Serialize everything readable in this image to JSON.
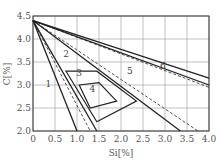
{
  "chart_data": {
    "type": "line",
    "title": "",
    "xlabel": "Si[%]",
    "ylabel": "C[%]",
    "xlim": [
      0,
      4.0
    ],
    "ylim": [
      2.0,
      4.5
    ],
    "grid": true,
    "x_ticks": [
      "0",
      "0.5",
      "1.0",
      "1.5",
      "2.0",
      "2.5",
      "3.0",
      "3.5",
      "4.0"
    ],
    "y_ticks": [
      "2.0",
      "2.5",
      "3.0",
      "3.5",
      "4.0",
      "4.5"
    ],
    "origin_point": {
      "si": 0,
      "c": 4.4
    },
    "boundary_lines": [
      {
        "name": "1/2 boundary",
        "style": "solid",
        "from": [
          0,
          4.4
        ],
        "to": [
          1.0,
          2.0
        ]
      },
      {
        "name": "2 left inner",
        "style": "dashed",
        "from": [
          0,
          4.4
        ],
        "to": [
          1.3,
          2.0
        ]
      },
      {
        "name": "2 right",
        "style": "solid",
        "from": [
          0,
          4.4
        ],
        "to": [
          1.45,
          2.0
        ]
      },
      {
        "name": "2/5 lower solid",
        "style": "solid",
        "from": [
          0,
          4.4
        ],
        "to": [
          3.35,
          2.0
        ]
      },
      {
        "name": "5 dashed",
        "style": "dashed",
        "from": [
          0,
          4.4
        ],
        "to": [
          3.75,
          2.0
        ]
      },
      {
        "name": "5/6 dashed",
        "style": "dashed",
        "from": [
          0,
          4.4
        ],
        "to": [
          4.0,
          2.95
        ]
      },
      {
        "name": "5/6 solid",
        "style": "solid",
        "from": [
          0,
          4.4
        ],
        "to": [
          4.0,
          3.0
        ]
      },
      {
        "name": "6 upper",
        "style": "solid",
        "from": [
          0,
          4.4
        ],
        "to": [
          4.0,
          3.15
        ]
      }
    ],
    "regions_polygons": [
      {
        "label": "3",
        "points": [
          [
            0.75,
            3.3
          ],
          [
            1.45,
            3.3
          ],
          [
            2.35,
            2.65
          ],
          [
            1.45,
            2.2
          ]
        ]
      },
      {
        "label": "4",
        "points": [
          [
            1.05,
            3.0
          ],
          [
            1.5,
            3.05
          ],
          [
            1.9,
            2.65
          ],
          [
            1.3,
            2.5
          ]
        ]
      }
    ],
    "region_labels": [
      {
        "label": "1",
        "si": 0.35,
        "c": 2.95
      },
      {
        "label": "2",
        "si": 0.75,
        "c": 3.6
      },
      {
        "label": "3",
        "si": 1.05,
        "c": 3.2
      },
      {
        "label": "4",
        "si": 1.35,
        "c": 2.85
      },
      {
        "label": "5",
        "si": 2.2,
        "c": 3.25
      },
      {
        "label": "6",
        "si": 2.95,
        "c": 3.35
      }
    ]
  },
  "labels": {
    "x_axis": "Si[%]",
    "y_axis": "C[%]"
  }
}
